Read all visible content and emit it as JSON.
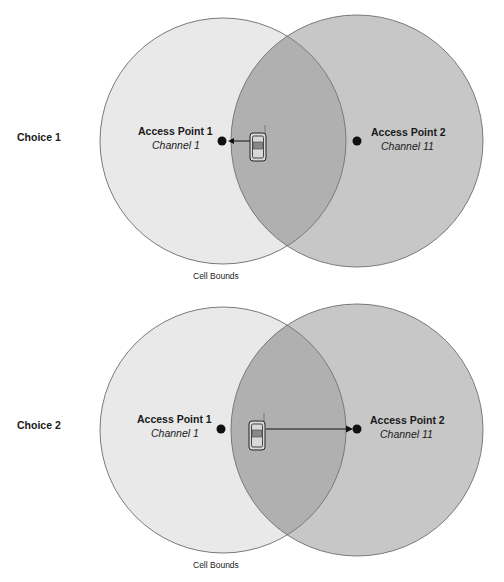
{
  "colors": {
    "cell1_fill": "#e9e9e9",
    "cell2_fill": "#c7c7c7",
    "overlap_fill": "#b0b0b0",
    "cell_stroke": "#7a7a7a",
    "dot": "#111111"
  },
  "choices": [
    {
      "label": "Choice 1",
      "access_points": [
        {
          "name": "Access Point 1",
          "channel": "Channel 1"
        },
        {
          "name": "Access Point 2",
          "channel": "Channel 11"
        }
      ],
      "cell_bounds_label": "Cell Bounds",
      "client_icon": "mobile-phone-icon",
      "association_arrow": "toward Access Point 1"
    },
    {
      "label": "Choice 2",
      "access_points": [
        {
          "name": "Access Point 1",
          "channel": "Channel 1"
        },
        {
          "name": "Access Point 2",
          "channel": "Channel 11"
        }
      ],
      "cell_bounds_label": "Cell Bounds",
      "client_icon": "mobile-phone-icon",
      "association_arrow": "toward Access Point 2"
    }
  ]
}
